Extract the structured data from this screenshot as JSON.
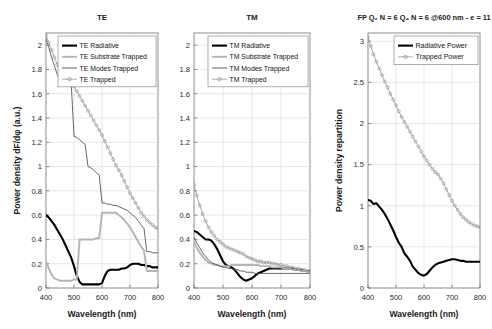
{
  "figure": {
    "panels": [
      {
        "id": "te",
        "title": "TE",
        "xlabel": "Wavelength (nm)",
        "ylabel": "Power density dF/dφ (a.u.)",
        "legend": [
          {
            "label": "TE Radiative",
            "style": "thick-black"
          },
          {
            "label": "TE Substrate Trapped",
            "style": "thick-grey"
          },
          {
            "label": "TE Modes Trapped",
            "style": "thin-dark"
          },
          {
            "label": "TE Trapped",
            "style": "marker-circle"
          }
        ]
      },
      {
        "id": "tm",
        "title": "TM",
        "xlabel": "Wavelength (nm)",
        "ylabel": "",
        "legend": [
          {
            "label": "TM Radiative",
            "style": "thick-black"
          },
          {
            "label": "TM Substrate Trapped",
            "style": "thick-grey"
          },
          {
            "label": "TM Modes Trapped",
            "style": "thin-dark"
          },
          {
            "label": "TM Trapped",
            "style": "marker-circle"
          }
        ]
      },
      {
        "id": "fp",
        "title": "FP Q₂ N = 6 Q₄ N = 6 @600 nm - e = 11",
        "xlabel": "Wavelength (nm)",
        "ylabel": "Power density repartition",
        "legend": [
          {
            "label": "Radiative Power",
            "style": "thick-black"
          },
          {
            "label": "Trapped Power",
            "style": "marker-circle"
          }
        ]
      }
    ]
  },
  "chart_data": [
    {
      "type": "line",
      "title": "TE",
      "xlabel": "Wavelength (nm)",
      "ylabel": "Power density dF/dφ (a.u.)",
      "xlim": [
        400,
        800
      ],
      "ylim": [
        0,
        2.1
      ],
      "xticks": [
        400,
        500,
        600,
        700,
        800
      ],
      "yticks": [
        0,
        0.2,
        0.4,
        0.6,
        0.8,
        1,
        1.2,
        1.4,
        1.6,
        1.8,
        2
      ],
      "grid": true,
      "legend_position": "top-right",
      "x": [
        400,
        410,
        420,
        430,
        440,
        450,
        460,
        470,
        480,
        490,
        500,
        510,
        520,
        530,
        540,
        550,
        560,
        570,
        580,
        590,
        600,
        610,
        620,
        630,
        640,
        650,
        660,
        670,
        680,
        690,
        700,
        710,
        720,
        730,
        740,
        750,
        760,
        770,
        780,
        790,
        800
      ],
      "series": [
        {
          "name": "TE Radiative",
          "values": [
            0.6,
            0.58,
            0.55,
            0.52,
            0.48,
            0.44,
            0.4,
            0.35,
            0.3,
            0.25,
            0.18,
            0.1,
            0.05,
            0.03,
            0.03,
            0.03,
            0.03,
            0.03,
            0.03,
            0.03,
            0.04,
            0.1,
            0.14,
            0.15,
            0.15,
            0.15,
            0.15,
            0.16,
            0.16,
            0.17,
            0.19,
            0.2,
            0.2,
            0.2,
            0.19,
            0.19,
            0.18,
            0.18,
            0.17,
            0.17,
            0.17
          ]
        },
        {
          "name": "TE Substrate Trapped",
          "values": [
            0.22,
            0.16,
            0.11,
            0.08,
            0.07,
            0.06,
            0.06,
            0.06,
            0.06,
            0.06,
            0.07,
            0.07,
            0.4,
            0.4,
            0.4,
            0.4,
            0.4,
            0.4,
            0.41,
            0.41,
            0.62,
            0.62,
            0.62,
            0.62,
            0.62,
            0.62,
            0.6,
            0.58,
            0.56,
            0.53,
            0.5,
            0.46,
            0.42,
            0.38,
            0.34,
            0.31,
            0.14,
            0.14,
            0.14,
            0.14,
            0.14
          ]
        },
        {
          "name": "TE Modes Trapped",
          "values": [
            2.05,
            1.98,
            1.9,
            1.83,
            1.76,
            1.71,
            1.7,
            1.69,
            1.69,
            1.69,
            1.25,
            1.24,
            1.22,
            1.2,
            1.18,
            1.0,
            0.99,
            0.97,
            0.95,
            0.93,
            0.7,
            0.7,
            0.69,
            0.69,
            0.68,
            0.68,
            0.67,
            0.66,
            0.65,
            0.64,
            0.62,
            0.6,
            0.58,
            0.55,
            0.52,
            0.49,
            0.3,
            0.3,
            0.29,
            0.29,
            0.29
          ]
        },
        {
          "name": "TE Trapped",
          "values": [
            2.08,
            2.02,
            1.96,
            1.9,
            1.84,
            1.78,
            1.75,
            1.72,
            1.7,
            1.68,
            1.66,
            1.62,
            1.58,
            1.54,
            1.5,
            1.46,
            1.42,
            1.38,
            1.34,
            1.3,
            1.26,
            1.21,
            1.16,
            1.11,
            1.06,
            1.01,
            0.97,
            0.93,
            0.88,
            0.83,
            0.78,
            0.74,
            0.7,
            0.66,
            0.62,
            0.59,
            0.56,
            0.54,
            0.52,
            0.5,
            0.49
          ]
        }
      ]
    },
    {
      "type": "line",
      "title": "TM",
      "xlabel": "Wavelength (nm)",
      "ylabel": "",
      "xlim": [
        400,
        800
      ],
      "ylim": [
        0,
        2.1
      ],
      "xticks": [
        400,
        500,
        600,
        700,
        800
      ],
      "yticks": [
        0,
        0.2,
        0.4,
        0.6,
        0.8,
        1,
        1.2,
        1.4,
        1.6,
        1.8,
        2
      ],
      "grid": true,
      "legend_position": "top-right",
      "x": [
        400,
        410,
        420,
        430,
        440,
        450,
        460,
        470,
        480,
        490,
        500,
        510,
        520,
        530,
        540,
        550,
        560,
        570,
        580,
        590,
        600,
        610,
        620,
        630,
        640,
        650,
        660,
        670,
        680,
        690,
        700,
        710,
        720,
        730,
        740,
        750,
        760,
        770,
        780,
        790,
        800
      ],
      "series": [
        {
          "name": "TM Radiative",
          "values": [
            0.47,
            0.46,
            0.44,
            0.42,
            0.4,
            0.4,
            0.39,
            0.36,
            0.32,
            0.27,
            0.22,
            0.19,
            0.18,
            0.17,
            0.15,
            0.12,
            0.09,
            0.07,
            0.06,
            0.07,
            0.08,
            0.1,
            0.12,
            0.13,
            0.14,
            0.15,
            0.16,
            0.16,
            0.16,
            0.16,
            0.16,
            0.16,
            0.16,
            0.16,
            0.16,
            0.15,
            0.15,
            0.15,
            0.14,
            0.14,
            0.14
          ]
        },
        {
          "name": "TM Substrate Trapped",
          "values": [
            0.38,
            0.33,
            0.29,
            0.26,
            0.23,
            0.21,
            0.2,
            0.19,
            0.19,
            0.18,
            0.18,
            0.18,
            0.18,
            0.19,
            0.19,
            0.19,
            0.19,
            0.19,
            0.19,
            0.19,
            0.19,
            0.19,
            0.19,
            0.18,
            0.18,
            0.18,
            0.18,
            0.17,
            0.17,
            0.17,
            0.17,
            0.16,
            0.16,
            0.16,
            0.15,
            0.15,
            0.15,
            0.14,
            0.14,
            0.14,
            0.13
          ]
        },
        {
          "name": "TM Modes Trapped",
          "values": [
            0.42,
            0.37,
            0.33,
            0.29,
            0.26,
            0.23,
            0.21,
            0.2,
            0.19,
            0.18,
            0.17,
            0.17,
            0.16,
            0.16,
            0.15,
            0.15,
            0.14,
            0.14,
            0.13,
            0.13,
            0.13,
            0.12,
            0.12,
            0.12,
            0.12,
            0.12,
            0.12,
            0.12,
            0.12,
            0.12,
            0.12,
            0.12,
            0.12,
            0.12,
            0.12,
            0.12,
            0.12,
            0.12,
            0.12,
            0.12,
            0.12
          ]
        },
        {
          "name": "TM Trapped",
          "values": [
            0.85,
            0.76,
            0.68,
            0.61,
            0.55,
            0.5,
            0.46,
            0.43,
            0.4,
            0.38,
            0.36,
            0.34,
            0.33,
            0.32,
            0.31,
            0.3,
            0.29,
            0.28,
            0.26,
            0.25,
            0.24,
            0.23,
            0.22,
            0.22,
            0.21,
            0.21,
            0.21,
            0.2,
            0.2,
            0.19,
            0.19,
            0.18,
            0.18,
            0.17,
            0.17,
            0.16,
            0.16,
            0.15,
            0.15,
            0.14,
            0.14
          ]
        }
      ]
    },
    {
      "type": "line",
      "title": "FP Q₂ N = 6 Q₄ N = 6 @600 nm - e = 11",
      "xlabel": "Wavelength (nm)",
      "ylabel": "Power density repartition",
      "xlim": [
        400,
        800
      ],
      "ylim": [
        0,
        3.1
      ],
      "xticks": [
        400,
        500,
        600,
        700,
        800
      ],
      "yticks": [
        0,
        0.5,
        1,
        1.5,
        2,
        2.5,
        3
      ],
      "grid": true,
      "legend_position": "top-right",
      "x": [
        400,
        410,
        420,
        430,
        440,
        450,
        460,
        470,
        480,
        490,
        500,
        510,
        520,
        530,
        540,
        550,
        560,
        570,
        580,
        590,
        600,
        610,
        620,
        630,
        640,
        650,
        660,
        670,
        680,
        690,
        700,
        710,
        720,
        730,
        740,
        750,
        760,
        770,
        780,
        790,
        800
      ],
      "series": [
        {
          "name": "Radiative Power",
          "values": [
            1.07,
            1.06,
            1.02,
            1.03,
            0.99,
            0.95,
            0.9,
            0.84,
            0.77,
            0.7,
            0.62,
            0.55,
            0.5,
            0.42,
            0.38,
            0.33,
            0.26,
            0.22,
            0.18,
            0.16,
            0.15,
            0.17,
            0.21,
            0.25,
            0.28,
            0.3,
            0.31,
            0.32,
            0.33,
            0.34,
            0.35,
            0.35,
            0.34,
            0.33,
            0.33,
            0.32,
            0.32,
            0.32,
            0.32,
            0.32,
            0.32
          ]
        },
        {
          "name": "Trapped Power",
          "values": [
            3.05,
            2.94,
            2.84,
            2.75,
            2.67,
            2.59,
            2.51,
            2.44,
            2.36,
            2.29,
            2.22,
            2.15,
            2.08,
            2.02,
            1.96,
            1.9,
            1.84,
            1.78,
            1.72,
            1.66,
            1.6,
            1.55,
            1.5,
            1.45,
            1.41,
            1.38,
            1.33,
            1.27,
            1.2,
            1.13,
            1.06,
            1.0,
            0.95,
            0.9,
            0.86,
            0.83,
            0.8,
            0.78,
            0.76,
            0.75,
            0.74
          ]
        }
      ]
    }
  ]
}
